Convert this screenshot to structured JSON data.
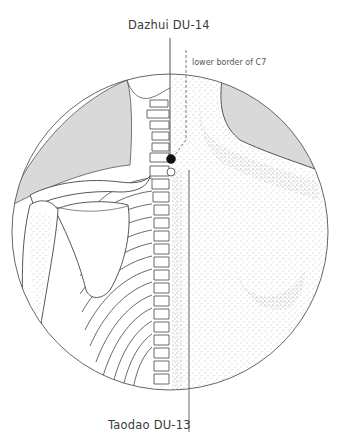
{
  "figure": {
    "view": "posterior view of upper back, left half skeletal (spine, ribs, scapula, clavicle, humerus), right half surface anatomy with stippled shading",
    "colors": {
      "line": "#555555",
      "dark_line": "#333333",
      "shade_gray": "#d9d9d9",
      "stipple": "#777777",
      "point_filled": "#111111",
      "point_open": "#ffffff"
    }
  },
  "labels": {
    "dazhui": "Dazhui DU-14",
    "c7_note": "lower border of C7",
    "taodao": "Taodao DU-13"
  },
  "points": [
    {
      "name": "Dazhui DU-14",
      "style": "filled-black-dot"
    },
    {
      "name": "Taodao DU-13",
      "style": "open-white-dot"
    }
  ]
}
